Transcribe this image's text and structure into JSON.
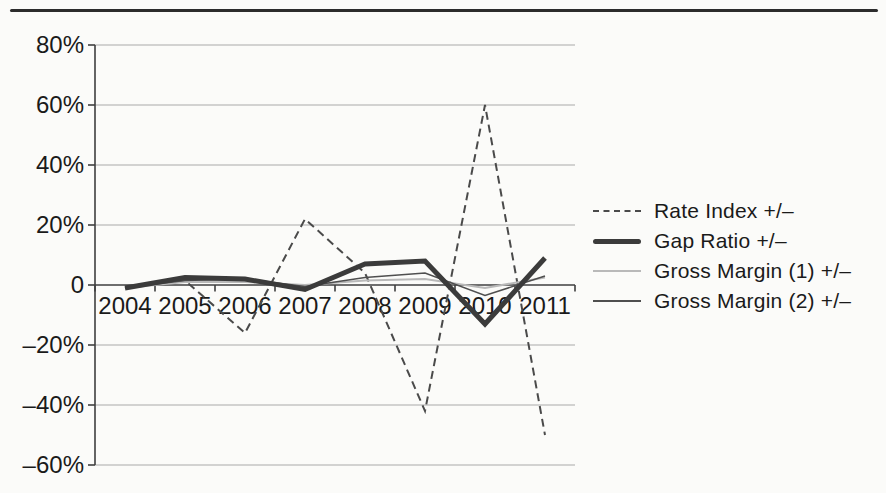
{
  "figure": {
    "background": "#fbfbf9",
    "rule_color": "#2c2c2c"
  },
  "chart_data": {
    "type": "line",
    "title": "",
    "xlabel": "",
    "ylabel": "",
    "categories": [
      "2004",
      "2005",
      "2006",
      "2007",
      "2008",
      "2009",
      "2010",
      "2011"
    ],
    "series": [
      {
        "name": "Rate Index +/–",
        "style": "dashed",
        "color": "#4a4a4a",
        "width": 2,
        "values": [
          -1,
          1.5,
          -16,
          22,
          4,
          -42,
          60,
          -50
        ]
      },
      {
        "name": "Gap Ratio +/–",
        "style": "solid",
        "color": "#3b3b3b",
        "width": 5,
        "values": [
          -1,
          2.5,
          2,
          -1.5,
          7,
          8,
          -13,
          9
        ]
      },
      {
        "name": "Gross Margin (1) +/–",
        "style": "solid",
        "color": "#b9b9b9",
        "width": 2,
        "values": [
          -1,
          1,
          1,
          0,
          1.5,
          2,
          -1,
          2.5
        ]
      },
      {
        "name": "Gross Margin (2) +/–",
        "style": "solid",
        "color": "#4f4f4f",
        "width": 1.6,
        "values": [
          -1,
          1.5,
          2,
          -0.5,
          2.5,
          4,
          -3.5,
          3
        ]
      }
    ],
    "ylim": [
      -60,
      80
    ],
    "ytick_step": 20,
    "ytick_labels": [
      "80%",
      "60%",
      "40%",
      "20%",
      "0",
      "–20%",
      "–40%",
      "–60%"
    ],
    "grid": true,
    "legend_position": "right",
    "axis_color": "#3f3f3f",
    "grid_color": "#a9a9a9",
    "label_color": "#1a1a1a"
  }
}
